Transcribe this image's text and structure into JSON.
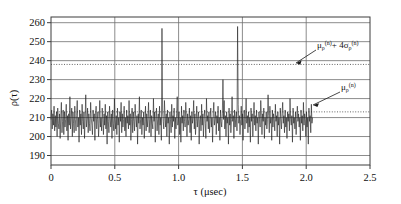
{
  "chart_data": {
    "type": "line",
    "title": "",
    "subtitle": "",
    "xlabel": "τ (μsec)",
    "ylabel": "ρ(τ)",
    "xlim": [
      0,
      2.5
    ],
    "ylim": [
      185,
      263
    ],
    "xticks": [
      0,
      0.5,
      1.0,
      1.5,
      2.0,
      2.5
    ],
    "xtick_labels": [
      "0",
      "0.5",
      "1.0",
      "1.5",
      "2.0",
      "2.5"
    ],
    "yticks": [
      190,
      200,
      210,
      220,
      230,
      240,
      250,
      260
    ],
    "ytick_labels": [
      "190",
      "200",
      "210",
      "220",
      "230",
      "240",
      "250",
      "260"
    ],
    "grid": true,
    "grid_axis": "both",
    "legend": "none",
    "series": [
      {
        "name": "rho_tau",
        "style": "solid",
        "color": "#222222",
        "x_start": 0.0,
        "x_end": 2.05,
        "baseline": 209.5,
        "noise_amplitude": 9.0,
        "n_points": 430,
        "values": [
          209,
          214,
          204,
          212,
          206,
          216,
          203,
          211,
          205,
          213,
          200,
          215,
          207,
          204,
          212,
          199,
          210,
          218,
          202,
          208,
          214,
          201,
          213,
          205,
          209,
          217,
          203,
          211,
          198,
          212,
          206,
          221,
          204,
          210,
          215,
          200,
          213,
          207,
          202,
          216,
          209,
          203,
          211,
          219,
          205,
          210,
          197,
          214,
          206,
          212,
          201,
          217,
          208,
          204,
          213,
          199,
          210,
          222,
          205,
          209,
          215,
          202,
          212,
          207,
          203,
          218,
          210,
          206,
          201,
          214,
          208,
          212,
          198,
          211,
          216,
          204,
          209,
          213,
          200,
          207,
          219,
          205,
          210,
          203,
          215,
          209,
          201,
          212,
          206,
          217,
          204,
          211,
          196,
          213,
          208,
          202,
          216,
          210,
          205,
          212,
          199,
          214,
          207,
          203,
          220,
          209,
          204,
          211,
          201,
          215,
          206,
          210,
          197,
          213,
          208,
          218,
          202,
          212,
          205,
          209,
          216,
          203,
          210,
          200,
          214,
          207,
          211,
          204,
          219,
          206,
          212,
          198,
          209,
          215,
          202,
          213,
          208,
          203,
          217,
          210,
          205,
          211,
          196,
          212,
          207,
          221,
          204,
          209,
          214,
          201,
          210,
          206,
          213,
          199,
          208,
          216,
          203,
          212,
          205,
          210,
          218,
          202,
          209,
          214,
          200,
          211,
          207,
          204,
          220,
          208,
          213,
          197,
          210,
          215,
          203,
          209,
          212,
          201,
          216,
          206,
          210,
          198,
          257,
          213,
          208,
          204,
          219,
          211,
          205,
          212,
          200,
          214,
          207,
          210,
          196,
          213,
          209,
          202,
          217,
          205,
          211,
          208,
          215,
          199,
          210,
          204,
          212,
          221,
          206,
          209,
          213,
          201,
          210,
          197,
          216,
          207,
          211,
          203,
          214,
          208,
          205,
          218,
          210,
          200,
          212,
          206,
          209,
          215,
          202,
          211,
          198,
          213,
          207,
          210,
          219,
          204,
          212,
          201,
          208,
          216,
          205,
          210,
          213,
          196,
          209,
          211,
          203,
          217,
          206,
          212,
          200,
          210,
          214,
          207,
          199,
          220,
          208,
          211,
          204,
          213,
          202,
          209,
          215,
          205,
          210,
          197,
          212,
          218,
          206,
          209,
          213,
          201,
          211,
          207,
          216,
          203,
          210,
          198,
          214,
          208,
          205,
          212,
          230,
          209,
          219,
          204,
          211,
          200,
          213,
          207,
          210,
          196,
          215,
          206,
          212,
          202,
          209,
          221,
          208,
          211,
          199,
          214,
          205,
          210,
          213,
          203,
          258,
          217,
          207,
          211,
          201,
          209,
          216,
          206,
          212,
          198,
          210,
          214,
          204,
          209,
          220,
          207,
          211,
          202,
          213,
          205,
          210,
          197,
          215,
          208,
          212,
          200,
          209,
          218,
          206,
          211,
          203,
          214,
          207,
          210,
          196,
          213,
          209,
          205,
          219,
          211,
          201,
          212,
          208,
          215,
          199,
          210,
          206,
          213,
          204,
          209,
          222,
          211,
          202,
          216,
          207,
          210,
          198,
          214,
          205,
          212,
          209,
          203,
          217,
          208,
          211,
          200,
          213,
          206,
          210,
          196,
          215,
          209,
          204,
          212,
          218,
          207,
          211,
          202,
          214,
          205,
          210,
          199,
          213,
          208,
          212,
          203,
          220,
          209,
          206,
          211,
          197,
          215,
          207,
          210,
          204,
          213,
          201,
          209,
          216,
          208,
          212,
          205,
          210,
          198,
          214,
          207,
          211,
          203,
          218,
          206,
          212,
          209,
          200,
          213,
          205,
          210,
          196,
          215,
          208,
          211,
          202,
          217,
          207,
          210
        ]
      }
    ],
    "reference_lines": [
      {
        "name": "mu-plus-4-sigma",
        "value": 238,
        "style": "dotted",
        "orientation": "horizontal",
        "label": "μρ(n) + 4σρ(n)"
      },
      {
        "name": "mu",
        "value": 213,
        "style": "dotted",
        "orientation": "horizontal",
        "label": "μρ(n)"
      }
    ],
    "annotations": [
      {
        "name": "threshold-annotation",
        "base": "μ",
        "base_sub": "ρ",
        "base_sup": "(n)",
        "operator": "+ 4",
        "second": "σ",
        "second_sub": "ρ",
        "second_sup": "(n)",
        "text": "μρ(n) + 4σρ(n)",
        "points_to": "mu-plus-4-sigma"
      },
      {
        "name": "mean-annotation",
        "base": "μ",
        "base_sub": "ρ",
        "base_sup": "(n)",
        "operator": "",
        "second": "",
        "second_sub": "",
        "second_sup": "",
        "text": "μρ(n)",
        "points_to": "mu"
      }
    ],
    "peaks": [
      {
        "tau": 0.74,
        "value": 257
      },
      {
        "tau": 1.51,
        "value": 258
      },
      {
        "tau": 1.36,
        "value": 230
      },
      {
        "tau": 0.13,
        "value": 226
      },
      {
        "tau": 0.5,
        "value": 222
      },
      {
        "tau": 1.44,
        "value": 222
      }
    ]
  },
  "figure": {
    "frame_color": "#3d3d3d",
    "grid_color": "#6e6e6e",
    "trace_color": "#222222",
    "background": "#ffffff"
  }
}
